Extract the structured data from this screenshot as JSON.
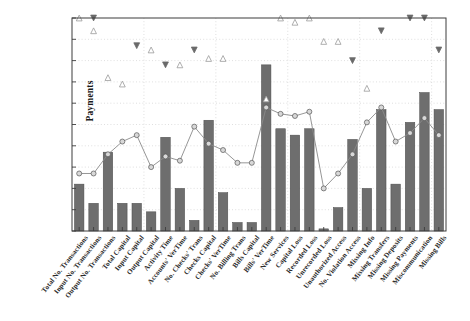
{
  "chart": {
    "type": "combo",
    "ylabel": "Payments",
    "xlabel": "",
    "title": "",
    "grid": true,
    "grid_style": "dotted",
    "legend": "none",
    "axis_color": "#3d3d3d",
    "plot_background": "#ffffff",
    "figure_background": "#ffffff"
  },
  "chart_data": {
    "type": "bar",
    "title": "",
    "xlabel": "",
    "ylabel": "Payments",
    "ylim": [
      0,
      100
    ],
    "xlim": [
      0,
      27
    ],
    "grid": true,
    "legend_position": "none",
    "bar_color": "#6e6e6e",
    "bar_edge_color": "#4a4a4a",
    "line_color": "#8a8a8a",
    "marker_face_color": "#d8d8d8",
    "marker_edge_color": "#555555",
    "up_triangle_color": "#9a9a9a",
    "down_triangle_color": "#6a6a6a",
    "categories": [
      "Total No. Transactions",
      "Input No. Transactions",
      "Output No. Transactions",
      "Total Capital",
      "Input Capital",
      "Output Capital",
      "Activity Time",
      "Accounts' VerTime",
      "No. Checks' Trans",
      "Checks Capital",
      "Checks' VerTime",
      "No. Billing Trans",
      "Bills Capital",
      "Bills' VerTime",
      "New Services",
      "Capital Loss",
      "Recorded Loss",
      "Unrecorded Loss",
      "Unauthorized Access",
      "No. Violation Access",
      "Missing Info",
      "Missing Transfers",
      "Missing Deposits",
      "Missing Payments",
      "Miscommunication",
      "Missing Bills"
    ],
    "series": [
      {
        "name": "bars",
        "render": "bar",
        "values": [
          22,
          13,
          37,
          13,
          13,
          9,
          44,
          20,
          5,
          52,
          18,
          4,
          4,
          78,
          48,
          45,
          48,
          1,
          11,
          43,
          20,
          57,
          22,
          51,
          65,
          57
        ]
      },
      {
        "name": "line",
        "render": "line-marker-circle",
        "values": [
          27,
          27,
          36,
          42,
          45,
          30,
          35,
          33,
          49,
          41,
          38,
          32,
          32,
          58,
          55,
          54,
          56,
          20,
          27,
          36,
          51,
          58,
          42,
          46,
          53,
          45
        ]
      },
      {
        "name": "up-markers",
        "render": "marker-triangle-up",
        "values": [
          100,
          94,
          72,
          69,
          null,
          85,
          null,
          78,
          null,
          81,
          81,
          null,
          null,
          62,
          100,
          98,
          100,
          89,
          89,
          null,
          67,
          null,
          null,
          null,
          null,
          null
        ]
      },
      {
        "name": "down-markers",
        "render": "marker-triangle-down",
        "values": [
          null,
          100,
          null,
          null,
          87,
          null,
          78,
          null,
          85,
          null,
          null,
          null,
          null,
          null,
          null,
          null,
          null,
          null,
          null,
          80,
          null,
          94,
          null,
          100,
          100,
          85
        ]
      }
    ]
  }
}
